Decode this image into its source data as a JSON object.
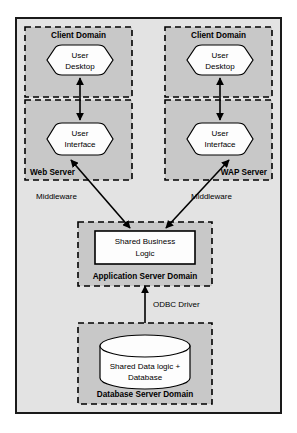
{
  "diagram": {
    "colors": {
      "page_background": "#ffffff",
      "outer_frame_fill": "#e3e3e3",
      "outer_frame_stroke": "#1a1a1a",
      "domain_fill": "#c8c8c8",
      "domain_stroke": "#000000",
      "node_fill": "#fdfdfd",
      "node_stroke": "#000000",
      "arrow_color": "#000000",
      "text_color": "#000000"
    },
    "domains": [
      {
        "id": "client-domain-left",
        "label": "Client Domain"
      },
      {
        "id": "client-domain-right",
        "label": "Client Domain"
      },
      {
        "id": "web-server",
        "label": "Web Server"
      },
      {
        "id": "wap-server",
        "label": "WAP Server"
      },
      {
        "id": "application-server",
        "label": "Application Server Domain"
      },
      {
        "id": "database-server",
        "label": "Database Server Domain"
      }
    ],
    "nodes": [
      {
        "id": "user-desktop-left",
        "shape": "hexagon",
        "line1": "User",
        "line2": "Desktop"
      },
      {
        "id": "user-desktop-right",
        "shape": "hexagon",
        "line1": "User",
        "line2": "Desktop"
      },
      {
        "id": "user-interface-left",
        "shape": "hexagon",
        "line1": "User",
        "line2": "Interface"
      },
      {
        "id": "user-interface-right",
        "shape": "hexagon",
        "line1": "User",
        "line2": "Interface"
      },
      {
        "id": "shared-business-logic",
        "shape": "rectangle",
        "line1": "Shared Business",
        "line2": "Logic"
      },
      {
        "id": "shared-database",
        "shape": "cylinder",
        "line1": "Shared Data  logic +",
        "line2": "Database"
      }
    ],
    "connector_labels": [
      {
        "id": "middleware-left",
        "text": "Middleware"
      },
      {
        "id": "middleware-right",
        "text": "Middleware"
      },
      {
        "id": "odbc-driver",
        "text": "ODBC Driver"
      }
    ]
  }
}
